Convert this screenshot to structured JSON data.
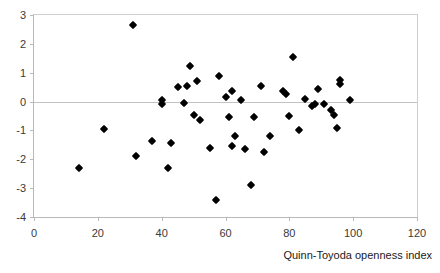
{
  "chart_data": {
    "type": "scatter",
    "title": "",
    "xlabel": "Quinn-Toyoda openness index",
    "ylabel": "",
    "xlim": [
      0,
      120
    ],
    "ylim": [
      -4,
      3
    ],
    "xticks": [
      0,
      20,
      40,
      60,
      80,
      100,
      120
    ],
    "yticks": [
      3,
      2,
      1,
      0,
      -1,
      -2,
      -3,
      -4
    ],
    "grid": false,
    "legend": null,
    "zero_line": 0,
    "marker": "diamond",
    "marker_color": "#000000",
    "points": [
      {
        "x": 14,
        "y": -2.3
      },
      {
        "x": 22,
        "y": -0.95
      },
      {
        "x": 31,
        "y": 2.65
      },
      {
        "x": 32,
        "y": -1.9
      },
      {
        "x": 37,
        "y": -1.35
      },
      {
        "x": 40,
        "y": 0.05
      },
      {
        "x": 40,
        "y": -0.1
      },
      {
        "x": 42,
        "y": -2.3
      },
      {
        "x": 43,
        "y": -1.45
      },
      {
        "x": 45,
        "y": 0.5
      },
      {
        "x": 47,
        "y": -0.05
      },
      {
        "x": 48,
        "y": 0.55
      },
      {
        "x": 49,
        "y": 1.25
      },
      {
        "x": 50,
        "y": -0.45
      },
      {
        "x": 51,
        "y": 0.7
      },
      {
        "x": 52,
        "y": -0.65
      },
      {
        "x": 55,
        "y": -1.6
      },
      {
        "x": 57,
        "y": -3.4
      },
      {
        "x": 58,
        "y": 0.9
      },
      {
        "x": 60,
        "y": 0.15
      },
      {
        "x": 61,
        "y": -0.55
      },
      {
        "x": 62,
        "y": 0.35
      },
      {
        "x": 62,
        "y": -1.55
      },
      {
        "x": 63,
        "y": -1.2
      },
      {
        "x": 65,
        "y": 0.05
      },
      {
        "x": 66,
        "y": -1.65
      },
      {
        "x": 68,
        "y": -2.9
      },
      {
        "x": 69,
        "y": -0.55
      },
      {
        "x": 71,
        "y": 0.55
      },
      {
        "x": 72,
        "y": -1.75
      },
      {
        "x": 74,
        "y": -1.2
      },
      {
        "x": 78,
        "y": 0.35
      },
      {
        "x": 79,
        "y": 0.25
      },
      {
        "x": 80,
        "y": -0.5
      },
      {
        "x": 81,
        "y": 1.55
      },
      {
        "x": 83,
        "y": -1.0
      },
      {
        "x": 85,
        "y": 0.1
      },
      {
        "x": 87,
        "y": -0.15
      },
      {
        "x": 88,
        "y": -0.1
      },
      {
        "x": 89,
        "y": 0.45
      },
      {
        "x": 91,
        "y": -0.1
      },
      {
        "x": 93,
        "y": -0.3
      },
      {
        "x": 94,
        "y": -0.45
      },
      {
        "x": 95,
        "y": -0.9
      },
      {
        "x": 96,
        "y": 0.75
      },
      {
        "x": 96,
        "y": 0.6
      },
      {
        "x": 99,
        "y": 0.05
      }
    ]
  },
  "axis": {
    "x_title": "Quinn-Toyoda openness index",
    "x_tick_labels": [
      "0",
      "20",
      "40",
      "60",
      "80",
      "100",
      "120"
    ],
    "y_tick_labels": [
      "3",
      "2",
      "1",
      "0",
      "-1",
      "-2",
      "-3",
      "-4"
    ]
  },
  "caption_remnant": ""
}
